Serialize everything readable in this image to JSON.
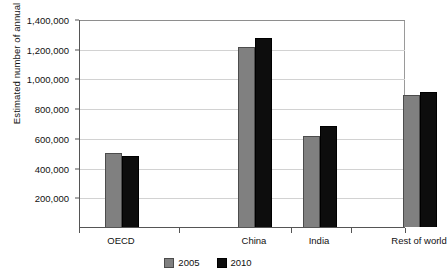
{
  "chart_data": {
    "type": "bar",
    "title": "",
    "subtitle": "",
    "xlabel": "",
    "ylabel": "Estimated number of annual deaths",
    "categories": [
      "OECD",
      "China",
      "India",
      "Rest of world"
    ],
    "series": [
      {
        "name": "2005",
        "color": "#808080",
        "values": [
          495000,
          1210000,
          610000,
          890000
        ]
      },
      {
        "name": "2010",
        "color": "#0d0d0d",
        "values": [
          475000,
          1270000,
          680000,
          910000
        ]
      }
    ],
    "ylim": [
      0,
      1400000
    ],
    "ytick_values": [
      200000,
      400000,
      600000,
      800000,
      1000000,
      1200000,
      1400000
    ],
    "ytick_labels": [
      "200,000",
      "400,000",
      "600,000",
      "800,000",
      "1,000,000",
      "1,200,000",
      "1,400,000"
    ],
    "grid": true,
    "grid_axis": "y",
    "legend_position": "bottom-center"
  },
  "legend": {
    "items": [
      {
        "label": "2005",
        "color": "#808080"
      },
      {
        "label": "2010",
        "color": "#0d0d0d"
      }
    ]
  },
  "axes": {
    "y_title": "Estimated number of annual deaths"
  }
}
